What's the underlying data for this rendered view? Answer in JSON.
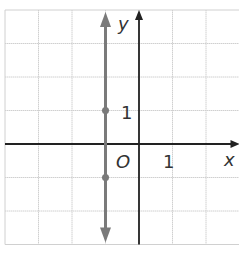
{
  "chart_data": {
    "type": "line",
    "title": "",
    "xlabel": "x",
    "ylabel": "y",
    "origin_label": "O",
    "xlim": [
      -4,
      3
    ],
    "ylim": [
      -3,
      4
    ],
    "grid": true,
    "tick_labels": {
      "x": [
        "1"
      ],
      "y": [
        "1"
      ]
    },
    "series": [
      {
        "name": "x = -1",
        "kind": "vertical-line",
        "x": -1,
        "arrows": "both",
        "color": "#7a7a7a",
        "points": [
          {
            "x": -1,
            "y": 1
          },
          {
            "x": -1,
            "y": -1
          }
        ]
      }
    ]
  },
  "colors": {
    "grid": "#d0d0d0",
    "axis": "#222222",
    "line": "#7a7a7a",
    "background": "#ffffff"
  }
}
